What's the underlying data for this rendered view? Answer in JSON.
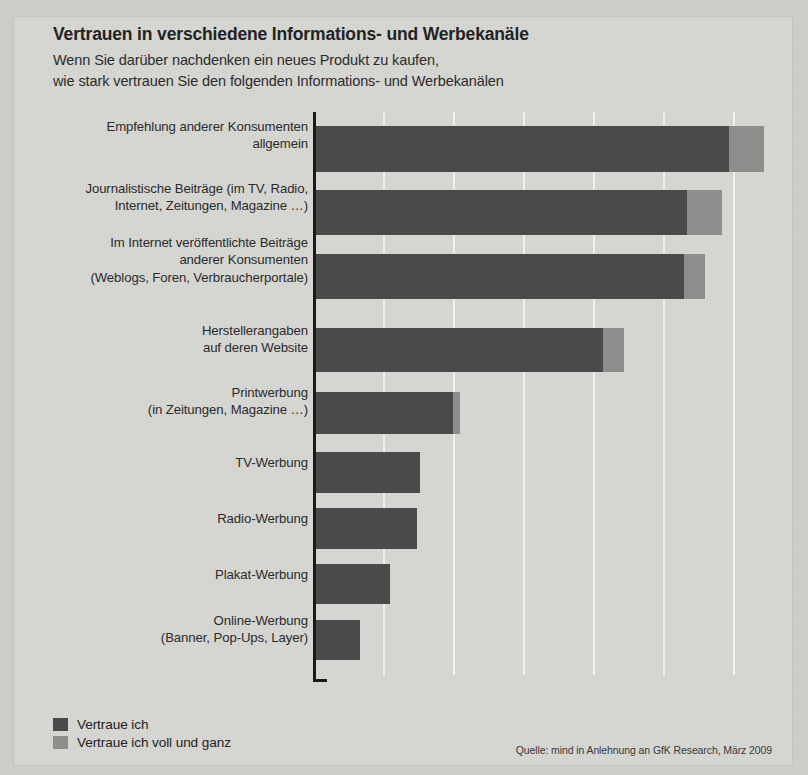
{
  "header": {
    "title": "Vertrauen in verschiedene Informations- und Werbekanäle",
    "subtitle_line1": "Wenn Sie darüber nachdenken ein neues Produkt zu kaufen,",
    "subtitle_line2": "wie stark vertrauen Sie den folgenden Informations- und Werbekanälen"
  },
  "legend": {
    "items": [
      {
        "label": "Vertraue ich",
        "color": "#4a4a4a",
        "key": "vertraue_ich"
      },
      {
        "label": "Vertraue ich voll und ganz",
        "color": "#8d8d8b",
        "key": "vertraue_voll"
      }
    ]
  },
  "source": "Quelle: mind in Anlehnung an GfK Research, März 2009",
  "chart_data": {
    "type": "bar",
    "orientation": "horizontal",
    "stacked": true,
    "title": "Vertrauen in verschiedene Informations- und Werbekanäle",
    "subtitle": "Wenn Sie darüber nachdenken ein neues Produkt zu kaufen, wie stark vertrauen Sie den folgenden Informations- und Werbekanälen",
    "xlabel": "",
    "ylabel": "",
    "xlim": [
      0,
      68
    ],
    "grid": true,
    "legend_position": "bottom-left",
    "tick_values": [
      0,
      10,
      20,
      30,
      40,
      50,
      60
    ],
    "tick_labels": [
      "0",
      "10%",
      "20%",
      "30%",
      "40%",
      "50%",
      "60%"
    ],
    "categories": [
      "Empfehlung anderer Konsumenten\nallgemein",
      "Journalistische Beiträge (im TV, Radio,\nInternet, Zeitungen, Magazine …)",
      "Im Internet veröffentlichte Beiträge\nanderer Konsumenten\n(Weblogs, Foren, Verbraucherportale)",
      "Herstellerangaben\nauf deren Website",
      "Printwerbung\n(in Zeitungen, Magazine …)",
      "TV-Werbung",
      "Radio-Werbung",
      "Plakat-Werbung",
      "Online-Werbung\n(Banner, Pop-Ups, Layer)"
    ],
    "series": [
      {
        "name": "Vertraue ich",
        "color": "#4a4a4a",
        "values": [
          59.0,
          53.0,
          52.5,
          41.0,
          19.5,
          14.8,
          14.4,
          10.5,
          6.3
        ]
      },
      {
        "name": "Vertraue ich voll und ganz",
        "color": "#8d8d8b",
        "values": [
          5.0,
          5.0,
          3.0,
          3.0,
          1.0,
          0,
          0,
          0,
          0
        ]
      }
    ],
    "totals": [
      64.0,
      58.0,
      55.5,
      44.0,
      20.5,
      14.8,
      14.4,
      10.5,
      6.3
    ]
  }
}
